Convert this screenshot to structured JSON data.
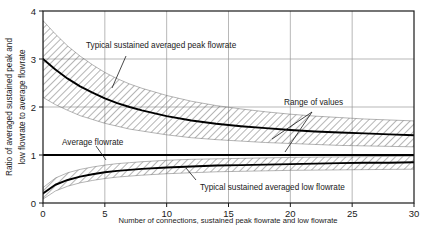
{
  "chart_data": {
    "type": "line",
    "title": "",
    "xlabel": "Number of connections, sustained peak flowrate and low flowrate",
    "ylabel_line1": "Ratio of averaged sustained peak and",
    "ylabel_line2": "low flowrate to average flowrate",
    "xlim": [
      0,
      30
    ],
    "ylim": [
      0,
      4
    ],
    "xticks": [
      0,
      5,
      10,
      15,
      20,
      25,
      30
    ],
    "xtick_labels": [
      "0",
      "5",
      "10",
      "15",
      "20",
      "25",
      "30"
    ],
    "yticks": [
      0,
      1,
      2,
      3,
      4
    ],
    "ytick_labels": [
      "0",
      "1",
      "2",
      "3",
      "4"
    ],
    "grid": true,
    "legend": "none",
    "x": [
      0,
      1,
      2,
      3,
      4,
      5,
      6,
      7,
      8,
      10,
      12,
      14,
      16,
      18,
      20,
      22,
      24,
      26,
      28,
      30
    ],
    "series": [
      {
        "name": "Typical sustained averaged peak flowrate",
        "style": "solid-thick",
        "values": [
          3.0,
          2.78,
          2.59,
          2.43,
          2.3,
          2.18,
          2.08,
          2.0,
          1.93,
          1.81,
          1.72,
          1.65,
          1.6,
          1.56,
          1.52,
          1.49,
          1.47,
          1.45,
          1.43,
          1.41
        ]
      },
      {
        "name": "Typical sustained averaged low flowrate",
        "style": "solid-thick",
        "values": [
          0.2,
          0.38,
          0.48,
          0.55,
          0.6,
          0.64,
          0.67,
          0.69,
          0.71,
          0.74,
          0.76,
          0.78,
          0.79,
          0.8,
          0.81,
          0.82,
          0.83,
          0.84,
          0.84,
          0.85
        ]
      },
      {
        "name": "Average flowrate",
        "style": "solid-thick-horizontal",
        "values": [
          1.0,
          1.0,
          1.0,
          1.0,
          1.0,
          1.0,
          1.0,
          1.0,
          1.0,
          1.0,
          1.0,
          1.0,
          1.0,
          1.0,
          1.0,
          1.0,
          1.0,
          1.0,
          1.0,
          1.0
        ]
      }
    ],
    "bands": [
      {
        "name": "Range of values (peak)",
        "upper": [
          3.8,
          3.52,
          3.27,
          3.06,
          2.88,
          2.72,
          2.59,
          2.48,
          2.39,
          2.24,
          2.12,
          2.03,
          1.96,
          1.9,
          1.85,
          1.81,
          1.78,
          1.75,
          1.73,
          1.71
        ],
        "lower": [
          2.2,
          2.05,
          1.93,
          1.82,
          1.74,
          1.66,
          1.6,
          1.54,
          1.5,
          1.42,
          1.36,
          1.32,
          1.29,
          1.26,
          1.24,
          1.22,
          1.2,
          1.19,
          1.18,
          1.17
        ]
      },
      {
        "name": "Range of values (low)",
        "upper": [
          0.32,
          0.52,
          0.63,
          0.7,
          0.75,
          0.79,
          0.82,
          0.84,
          0.86,
          0.89,
          0.91,
          0.92,
          0.93,
          0.94,
          0.95,
          0.955,
          0.96,
          0.965,
          0.97,
          0.975
        ],
        "lower": [
          0.08,
          0.25,
          0.35,
          0.42,
          0.47,
          0.51,
          0.54,
          0.56,
          0.58,
          0.61,
          0.63,
          0.65,
          0.66,
          0.67,
          0.68,
          0.685,
          0.69,
          0.695,
          0.7,
          0.705
        ]
      }
    ],
    "annotations": [
      {
        "key": "peak_label",
        "text": "Typical sustained averaged peak flowrate"
      },
      {
        "key": "range_label",
        "text": "Range of values"
      },
      {
        "key": "average_label",
        "text": "Average flowrate"
      },
      {
        "key": "low_label",
        "text": "Typical sustained averaged low flowrate"
      }
    ],
    "colors": {
      "curve": "#000000",
      "axis": "#1a1a1a",
      "grid": "#9a9a9a",
      "hatch": "#555555",
      "background": "#ffffff"
    }
  }
}
